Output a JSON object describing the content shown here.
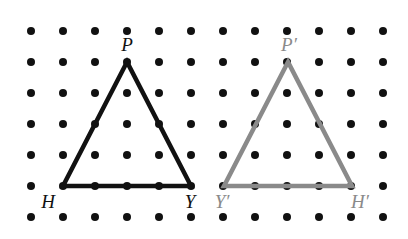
{
  "figure": {
    "width": 408,
    "height": 239,
    "background_color": "#ffffff"
  },
  "grid": {
    "name": "dot-lattice",
    "columns": 12,
    "rows": 7,
    "origin_x": 31,
    "origin_y": 31,
    "spacing_x": 32,
    "spacing_y": 31,
    "dot_radius": 4,
    "dot_color": "#111111"
  },
  "shapes": [
    {
      "id": "triangle-pre-image",
      "name": "triangle-PHY",
      "stroke_color": "#111111",
      "stroke_width": 4.5,
      "vertices": [
        {
          "label": "P",
          "x": 127,
          "y": 62
        },
        {
          "label": "H",
          "x": 63,
          "y": 186
        },
        {
          "label": "Y",
          "x": 191,
          "y": 186
        }
      ]
    },
    {
      "id": "triangle-image",
      "name": "triangle-P-prime-Y-prime-H-prime",
      "stroke_color": "#8a8a8a",
      "stroke_width": 4.5,
      "vertices": [
        {
          "label": "P'",
          "x": 288,
          "y": 62
        },
        {
          "label": "Y'",
          "x": 224,
          "y": 186
        },
        {
          "label": "H'",
          "x": 352,
          "y": 186
        }
      ]
    }
  ],
  "labels": [
    {
      "id": "label-p",
      "text": "P",
      "x": 127,
      "y": 44,
      "color_class": "label-black"
    },
    {
      "id": "label-h",
      "text": "H",
      "x": 48,
      "y": 201,
      "color_class": "label-black"
    },
    {
      "id": "label-y",
      "text": "Y",
      "x": 190,
      "y": 201,
      "color_class": "label-black"
    },
    {
      "id": "label-p-prime",
      "text": "P′",
      "x": 289,
      "y": 44,
      "color_class": "label-gray"
    },
    {
      "id": "label-y-prime",
      "text": "Y′",
      "x": 222,
      "y": 201,
      "color_class": "label-gray"
    },
    {
      "id": "label-h-prime",
      "text": "H′",
      "x": 360,
      "y": 201,
      "color_class": "label-gray"
    }
  ]
}
